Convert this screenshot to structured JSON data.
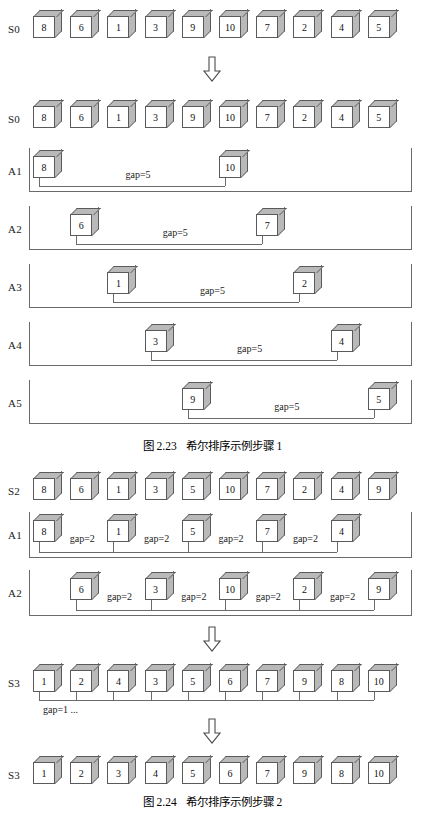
{
  "figure": {
    "topic": "Shell sort example",
    "cube_face_color": "#ffffff",
    "cube_shade_color": "#b9b9b9",
    "line_color": "#6a6a6a"
  },
  "section1": {
    "caption_number": "图 2.23",
    "caption_text": "希尔排序示例步骤 1",
    "rows": [
      {
        "label": "S0",
        "kind": "array",
        "values": [
          "8",
          "6",
          "1",
          "3",
          "9",
          "10",
          "7",
          "2",
          "4",
          "5"
        ]
      },
      {
        "label": "S0",
        "kind": "array",
        "values": [
          "8",
          "6",
          "1",
          "3",
          "9",
          "10",
          "7",
          "2",
          "4",
          "5"
        ]
      },
      {
        "label": "A1",
        "kind": "pair",
        "gap_label": "gap=5",
        "slots": [
          {
            "index": 0,
            "value": "8"
          },
          {
            "index": 5,
            "value": "10"
          }
        ]
      },
      {
        "label": "A2",
        "kind": "pair",
        "gap_label": "gap=5",
        "slots": [
          {
            "index": 1,
            "value": "6"
          },
          {
            "index": 6,
            "value": "7"
          }
        ]
      },
      {
        "label": "A3",
        "kind": "pair",
        "gap_label": "gap=5",
        "slots": [
          {
            "index": 2,
            "value": "1"
          },
          {
            "index": 7,
            "value": "2"
          }
        ]
      },
      {
        "label": "A4",
        "kind": "pair",
        "gap_label": "gap=5",
        "slots": [
          {
            "index": 3,
            "value": "3"
          },
          {
            "index": 8,
            "value": "4"
          }
        ]
      },
      {
        "label": "A5",
        "kind": "pair",
        "gap_label": "gap=5",
        "slots": [
          {
            "index": 4,
            "value": "9"
          },
          {
            "index": 9,
            "value": "5"
          }
        ]
      }
    ],
    "arrow_between_rows": "down-arrow"
  },
  "section2": {
    "caption_number": "图 2.24",
    "caption_text": "希尔排序示例步骤 2",
    "rows": [
      {
        "label": "S2",
        "kind": "array",
        "values": [
          "8",
          "6",
          "1",
          "3",
          "5",
          "10",
          "7",
          "2",
          "4",
          "9"
        ]
      },
      {
        "label": "A1",
        "kind": "chain",
        "gap_label": "gap=2",
        "gap_labels": [
          "gap=2",
          "gap=2",
          "gap=2",
          "gap=2"
        ],
        "slots": [
          {
            "index": 0,
            "value": "8"
          },
          {
            "index": 2,
            "value": "1"
          },
          {
            "index": 4,
            "value": "5"
          },
          {
            "index": 6,
            "value": "7"
          },
          {
            "index": 8,
            "value": "4"
          }
        ]
      },
      {
        "label": "A2",
        "kind": "chain",
        "gap_label": "gap=2",
        "gap_labels": [
          "gap=2",
          "gap=2",
          "gap=2",
          "gap=2"
        ],
        "slots": [
          {
            "index": 1,
            "value": "6"
          },
          {
            "index": 3,
            "value": "3"
          },
          {
            "index": 5,
            "value": "10"
          },
          {
            "index": 7,
            "value": "2"
          },
          {
            "index": 9,
            "value": "9"
          }
        ]
      },
      {
        "label": "S3",
        "kind": "comb",
        "gap_label": "gap=1 ...",
        "values": [
          "1",
          "2",
          "4",
          "3",
          "5",
          "6",
          "7",
          "9",
          "8",
          "10"
        ]
      },
      {
        "label": "S3",
        "kind": "array",
        "values": [
          "1",
          "2",
          "3",
          "4",
          "5",
          "6",
          "7",
          "9",
          "8",
          "10"
        ]
      }
    ],
    "arrow_between_rows": "down-arrow"
  }
}
